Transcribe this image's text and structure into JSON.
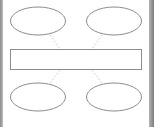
{
  "diagram": {
    "type": "hub-and-spoke",
    "colors": {
      "background": "#ffffff",
      "shape_stroke": "#8c8c8c",
      "connector_stroke": "#c4c4c4",
      "frame_border": "#8a8a8a"
    },
    "nodes": [
      {
        "id": "top-left",
        "shape": "ellipse",
        "label": ""
      },
      {
        "id": "top-right",
        "shape": "ellipse",
        "label": ""
      },
      {
        "id": "center",
        "shape": "rectangle",
        "label": ""
      },
      {
        "id": "bottom-left",
        "shape": "ellipse",
        "label": ""
      },
      {
        "id": "bottom-right",
        "shape": "ellipse",
        "label": ""
      }
    ],
    "edges": [
      {
        "from": "top-left",
        "to": "center",
        "style": "dashed"
      },
      {
        "from": "top-right",
        "to": "center",
        "style": "dashed"
      },
      {
        "from": "bottom-left",
        "to": "center",
        "style": "dashed"
      },
      {
        "from": "bottom-right",
        "to": "center",
        "style": "dashed"
      }
    ]
  }
}
